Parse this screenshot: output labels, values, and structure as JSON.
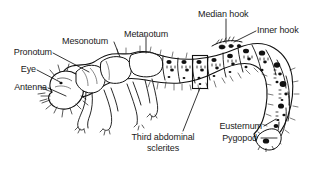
{
  "figure": {
    "background_color": "#ffffff",
    "ink_color": "#111111",
    "label_color": "#1a1a1a"
  },
  "labels": {
    "pronotum": "Pronotum",
    "eye": "Eye",
    "antenna": "Antenna",
    "mesonotum": "Mesonotum",
    "metanotum": "Metanotum",
    "median_hook": "Median hook",
    "inner_hook": "Inner hook",
    "third_abdominal_sclerites_line1": "Third abdominal",
    "third_abdominal_sclerites_line2": "sclerites",
    "eusternum": "Eusternum",
    "pygopod": "Pygopod"
  }
}
